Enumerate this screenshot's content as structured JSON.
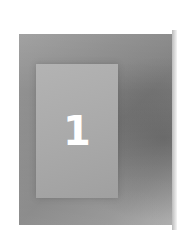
{
  "card": {
    "number": "1",
    "colors": {
      "background": "#ffffff",
      "outer": "#8a8a8a",
      "inner": "#aaaaaa",
      "number": "#ffffff"
    }
  }
}
